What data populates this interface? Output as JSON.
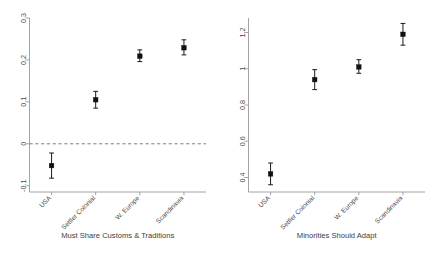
{
  "figure": {
    "background_color": "#ffffff",
    "panel_count": 2,
    "marker_color": "#111111",
    "axis_color": "#9a9a9a"
  },
  "chart_data": [
    {
      "type": "scatter",
      "panel": "left",
      "title": "",
      "xlabel": "Must Share Customs & Traditions",
      "ylabel": "",
      "categories": [
        "USA",
        "Settler Colonial",
        "W. Europe",
        "Scandinavia"
      ],
      "values": [
        -0.052,
        0.105,
        0.209,
        0.229
      ],
      "ci_low": [
        -0.082,
        0.085,
        0.196,
        0.212
      ],
      "ci_high": [
        -0.022,
        0.125,
        0.224,
        0.248
      ],
      "ytick_labels": [
        "-0.1",
        "0",
        "0.1",
        "0.2",
        "0.3"
      ],
      "ytick_values": [
        -0.1,
        0,
        0.1,
        0.2,
        0.3
      ],
      "ylim": [
        -0.115,
        0.3
      ],
      "grid": false,
      "reference_line": 0,
      "reference_line_style": "dashed",
      "legend": null
    },
    {
      "type": "scatter",
      "panel": "right",
      "title": "",
      "xlabel": "Minorities Should Adapt",
      "ylabel": "",
      "categories": [
        "USA",
        "Settler Colonial",
        "W. Europe",
        "Scandinavia"
      ],
      "values": [
        0.42,
        0.94,
        1.01,
        1.19
      ],
      "ci_low": [
        0.36,
        0.885,
        0.975,
        1.13
      ],
      "ci_high": [
        0.48,
        0.995,
        1.05,
        1.25
      ],
      "ytick_labels": [
        "0.4",
        "0.6",
        "0.8",
        "1",
        "1.2"
      ],
      "ytick_values": [
        0.4,
        0.6,
        0.8,
        1.0,
        1.2
      ],
      "ylim": [
        0.32,
        1.28
      ],
      "grid": false,
      "reference_line": null,
      "reference_line_style": null,
      "legend": null
    }
  ]
}
